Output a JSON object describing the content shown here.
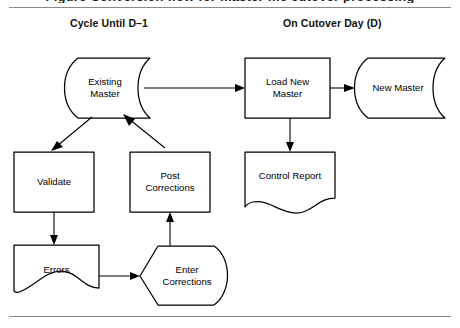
{
  "page": {
    "clipped_caption_top": "Figure  Conversion flow for master file cutover processing",
    "background_color": "#ffffff",
    "line_color": "#000000",
    "rule_color": "#8a8a8a"
  },
  "columns": [
    {
      "id": "cycle",
      "label": "Cycle Until D–1"
    },
    {
      "id": "cutover",
      "label": "On Cutover Day (D)"
    }
  ],
  "diagram": {
    "type": "flowchart",
    "nodes": [
      {
        "id": "existing-master",
        "label": "Existing\nMaster",
        "shape": "magnetic-tape",
        "x": 60,
        "y": 58,
        "w": 90,
        "h": 60
      },
      {
        "id": "validate",
        "label": "Validate",
        "shape": "process",
        "x": 14,
        "y": 152,
        "w": 80,
        "h": 60
      },
      {
        "id": "post-corrections",
        "label": "Post\nCorrections",
        "shape": "process",
        "x": 130,
        "y": 152,
        "w": 80,
        "h": 60
      },
      {
        "id": "errors",
        "label": "Errors",
        "shape": "document",
        "x": 14,
        "y": 245,
        "w": 85,
        "h": 60
      },
      {
        "id": "enter-corrections",
        "label": "Enter\nCorrections",
        "shape": "manual-input",
        "x": 140,
        "y": 245,
        "w": 90,
        "h": 62
      },
      {
        "id": "load-new-master",
        "label": "Load New\nMaster",
        "shape": "process",
        "x": 245,
        "y": 58,
        "w": 85,
        "h": 60
      },
      {
        "id": "new-master",
        "label": "New Master",
        "shape": "magnetic-tape",
        "x": 350,
        "y": 58,
        "w": 95,
        "h": 60
      },
      {
        "id": "control-report",
        "label": "Control Report",
        "shape": "document",
        "x": 245,
        "y": 152,
        "w": 90,
        "h": 60
      }
    ],
    "edges": [
      {
        "id": "existing-to-load",
        "from": "existing-master",
        "to": "load-new-master"
      },
      {
        "id": "existing-to-validate",
        "from": "existing-master",
        "to": "validate"
      },
      {
        "id": "post-to-existing",
        "from": "post-corrections",
        "to": "existing-master"
      },
      {
        "id": "validate-to-errors",
        "from": "validate",
        "to": "errors"
      },
      {
        "id": "errors-to-enter",
        "from": "errors",
        "to": "enter-corrections"
      },
      {
        "id": "enter-to-post",
        "from": "enter-corrections",
        "to": "post-corrections"
      },
      {
        "id": "load-to-new-master",
        "from": "load-new-master",
        "to": "new-master"
      },
      {
        "id": "load-to-control-report",
        "from": "load-new-master",
        "to": "control-report"
      }
    ]
  }
}
